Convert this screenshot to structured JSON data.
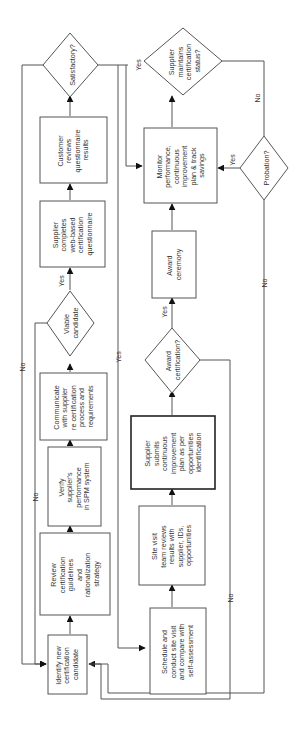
{
  "diagram": {
    "type": "flowchart",
    "orientation": "rotated-90-ccw",
    "colors": {
      "stroke": "#555555",
      "text": "#333333",
      "arrow": "#111111",
      "background": "#ffffff"
    },
    "nodes": [
      {
        "id": "identify",
        "shape": "box",
        "lines": [
          "Identify new",
          "certification",
          "candidate"
        ]
      },
      {
        "id": "review",
        "shape": "box",
        "lines": [
          "Review",
          "certification",
          "guidelines",
          "and",
          "rationalization",
          "strategy"
        ]
      },
      {
        "id": "verify",
        "shape": "box",
        "lines": [
          "Verify",
          "supplier's",
          "performance",
          "in SPM system"
        ]
      },
      {
        "id": "communicate",
        "shape": "box",
        "lines": [
          "Communicate",
          "with supplier",
          "re certification",
          "process and",
          "requirements"
        ]
      },
      {
        "id": "viable",
        "shape": "diamond",
        "lines": [
          "Viable",
          "candidate"
        ]
      },
      {
        "id": "questionnaire",
        "shape": "box",
        "lines": [
          "Supplier",
          "completes",
          "web-based",
          "certification",
          "questionnaire"
        ]
      },
      {
        "id": "customer_reviews",
        "shape": "box",
        "lines": [
          "Customer",
          "reviews",
          "questionnaire",
          "results"
        ]
      },
      {
        "id": "satisfactory",
        "shape": "diamond",
        "lines": [
          "Satisfactory?"
        ]
      },
      {
        "id": "schedule",
        "shape": "box",
        "lines": [
          "Schedule and",
          "conduct site visit",
          "and compare with",
          "self-assessment"
        ]
      },
      {
        "id": "site_visit",
        "shape": "box",
        "lines": [
          "Site visit",
          "team reviews",
          "results with",
          "supplier, IDs,",
          "opportunities"
        ]
      },
      {
        "id": "submits_plan",
        "shape": "box-bold",
        "lines": [
          "Supplier",
          "submits",
          "continuous",
          "improvement",
          "plan as per",
          "opportunities",
          "identification"
        ]
      },
      {
        "id": "award_cert",
        "shape": "diamond",
        "lines": [
          "Award",
          "certification?"
        ]
      },
      {
        "id": "award_ceremony",
        "shape": "box",
        "lines": [
          "Award",
          "ceremony"
        ]
      },
      {
        "id": "monitor",
        "shape": "box",
        "lines": [
          "Monitor",
          "performance,",
          "continuous",
          "improvement",
          "plan & track",
          "savings"
        ]
      },
      {
        "id": "maintains",
        "shape": "diamond",
        "lines": [
          "Supplier",
          "maintains",
          "certification",
          "status?"
        ]
      },
      {
        "id": "probation",
        "shape": "diamond",
        "lines": [
          "Probation?"
        ]
      }
    ],
    "edge_labels": {
      "viable_yes": "Yes",
      "viable_no": "No",
      "satisfactory_yes_top": "Yes",
      "satisfactory_yes_schedule": "Yes",
      "satisfactory_no": "No",
      "award_yes": "Yes",
      "award_no": "No",
      "maintains_no": "No",
      "probation_yes": "Yes",
      "probation_no": "No"
    }
  }
}
